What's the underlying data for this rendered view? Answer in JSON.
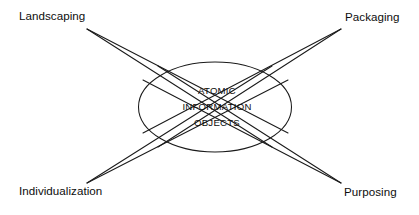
{
  "diagram": {
    "title": "Atomic Information Objects",
    "type": "hub-and-spoke",
    "background_color": "#ffffff",
    "line_color": "#1a1a1a",
    "text_color": "#0d0d0d",
    "hub": {
      "shape": "ellipse",
      "line1": "ATOMIC",
      "line2": "INFORMATION",
      "line3": "OBJECTS"
    },
    "nodes": [
      {
        "id": "landscaping",
        "label": "Landscaping",
        "position": "top-left"
      },
      {
        "id": "packaging",
        "label": "Packaging",
        "position": "top-right"
      },
      {
        "id": "individualization",
        "label": "Individualization",
        "position": "bottom-left"
      },
      {
        "id": "purposing",
        "label": "Purposing",
        "position": "bottom-right"
      }
    ]
  }
}
